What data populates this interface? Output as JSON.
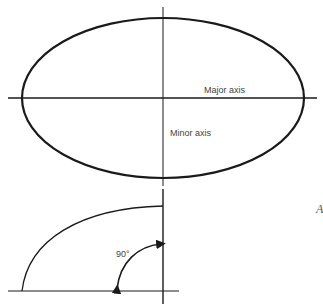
{
  "diagram": {
    "ellipse": {
      "major_axis_label": "Major axis",
      "minor_axis_label": "Minor axis"
    },
    "quarter": {
      "angle_label": "90°"
    },
    "edge_letter": "A"
  },
  "colors": {
    "stroke": "#1a1a1a",
    "text": "#444444",
    "background": "#ffffff"
  }
}
